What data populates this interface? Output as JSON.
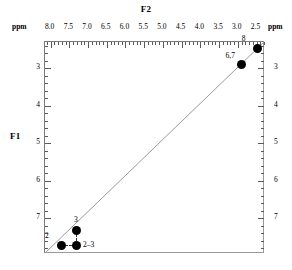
{
  "figure": {
    "f2_axis_title": "F2",
    "f1_axis_title": "F1",
    "unit_top_left": "ppm",
    "unit_top_right": "ppm"
  },
  "chart_data": {
    "type": "scatter",
    "title": "",
    "subtitle": "",
    "xlabel": "F2",
    "ylabel": "F1",
    "xunit": "ppm",
    "yunit": "ppm",
    "grid": false,
    "legend": "none",
    "x_axis": {
      "position": "top",
      "reversed": true,
      "range": [
        8.15,
        2.3
      ],
      "major_step": 0.5,
      "minor_per_major": 5,
      "tick_labels": [
        "8.0",
        "7.5",
        "7.0",
        "6.5",
        "6.0",
        "5.5",
        "5.0",
        "4.5",
        "4.0",
        "3.5",
        "3.0",
        "2.5"
      ],
      "tick_values": [
        8.0,
        7.5,
        7.0,
        6.5,
        6.0,
        5.5,
        5.0,
        4.5,
        4.0,
        3.5,
        3.0,
        2.5
      ]
    },
    "y_axis": {
      "position": "both",
      "reversed": true,
      "range": [
        2.3,
        7.92
      ],
      "major_step": 1.0,
      "minor_per_major": 5,
      "tick_labels": [
        "3",
        "4",
        "5",
        "6",
        "7"
      ],
      "tick_values": [
        3,
        4,
        5,
        6,
        7
      ]
    },
    "diagonal_line": {
      "shown": true,
      "from": [
        8.15,
        7.92
      ],
      "to": [
        2.3,
        2.3
      ],
      "color": "#999999"
    },
    "points": [
      {
        "id": "8",
        "label": "8",
        "f2": 2.47,
        "f1": 2.47,
        "kind": "diagonal",
        "label_pos": "top-left"
      },
      {
        "id": "6,7",
        "label": "6,7",
        "f2": 2.9,
        "f1": 2.9,
        "kind": "diagonal",
        "label_pos": "top-left"
      },
      {
        "id": "3",
        "label": "3",
        "f2": 7.32,
        "f1": 7.32,
        "kind": "diagonal",
        "label_pos": "top"
      },
      {
        "id": "2",
        "label": "2",
        "f2": 7.72,
        "f1": 7.72,
        "kind": "diagonal",
        "label_pos": "top-left"
      },
      {
        "id": "2-3",
        "label": "2–3",
        "f2": 7.32,
        "f1": 7.72,
        "kind": "cross",
        "label_pos": "right"
      }
    ],
    "connectors": [
      {
        "from": "3",
        "to": "2-3",
        "style": "dashed",
        "orientation": "vertical"
      },
      {
        "from": "2",
        "to": "2-3",
        "style": "dashed",
        "orientation": "horizontal"
      }
    ]
  }
}
